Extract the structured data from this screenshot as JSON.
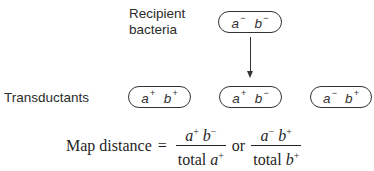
{
  "diagram": {
    "recipient_label_line1": "Recipient",
    "recipient_label_line2": "bacteria",
    "recipient_genotype": {
      "a": "a",
      "a_sign": "−",
      "b": "b",
      "b_sign": "−"
    },
    "transductants_label": "Transductants",
    "transductants": [
      {
        "a": "a",
        "a_sign": "+",
        "b": "b",
        "b_sign": "+"
      },
      {
        "a": "a",
        "a_sign": "+",
        "b": "b",
        "b_sign": "−"
      },
      {
        "a": "a",
        "a_sign": "−",
        "b": "b",
        "b_sign": "+"
      }
    ],
    "arrow": "arrow-down"
  },
  "formula": {
    "lhs": "Map distance",
    "equals": "=",
    "frac1": {
      "num_a": "a",
      "num_a_sign": "+",
      "num_b": "b",
      "num_b_sign": "−",
      "den_text": "total",
      "den_var": "a",
      "den_sign": "+"
    },
    "or": "or",
    "frac2": {
      "num_a": "a",
      "num_a_sign": "−",
      "num_b": "b",
      "num_b_sign": "+",
      "den_text": "total",
      "den_var": "b",
      "den_sign": "+"
    }
  }
}
